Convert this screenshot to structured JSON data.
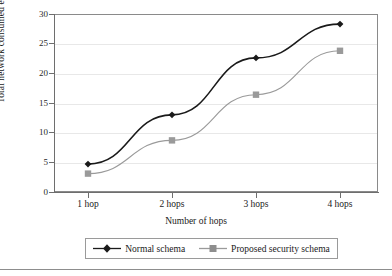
{
  "chart_data": {
    "type": "line",
    "title": "",
    "xlabel": "Number of hops",
    "ylabel": "Total network consumed energy (J)",
    "categories": [
      "1 hop",
      "2 hops",
      "3 hops",
      "4 hops"
    ],
    "yticks": [
      "0",
      "5",
      "10",
      "15",
      "20",
      "25",
      "30"
    ],
    "ylim": [
      0,
      30
    ],
    "grid": "horizontal",
    "legend_position": "bottom",
    "series": [
      {
        "name": "Normal schema",
        "values": [
          4.7,
          13.0,
          22.6,
          28.3
        ],
        "color": "#1a1a1a",
        "marker": "diamond"
      },
      {
        "name": "Proposed security schema",
        "values": [
          3.1,
          8.7,
          16.4,
          23.8
        ],
        "color": "#9a9a9a",
        "marker": "square"
      }
    ]
  },
  "axes": {
    "y_title": "Total network consumed energy (J)",
    "x_title": "Number of hops",
    "y_ticks": [
      "30",
      "25",
      "20",
      "15",
      "10",
      "5",
      "0"
    ],
    "x_ticks": [
      "1 hop",
      "2 hops",
      "3 hops",
      "4 hops"
    ]
  },
  "legend": {
    "items": [
      {
        "label": "Normal schema",
        "marker": "diamond-marker",
        "color": "#1a1a1a"
      },
      {
        "label": "Proposed security schema",
        "marker": "square-marker",
        "color": "#9a9a9a"
      }
    ]
  },
  "colors": {
    "series_normal": "#1a1a1a",
    "series_proposed": "#9a9a9a",
    "grid": "#e8e8e8",
    "frame": "#8a8a8a",
    "axis": "#6e6e6e"
  }
}
